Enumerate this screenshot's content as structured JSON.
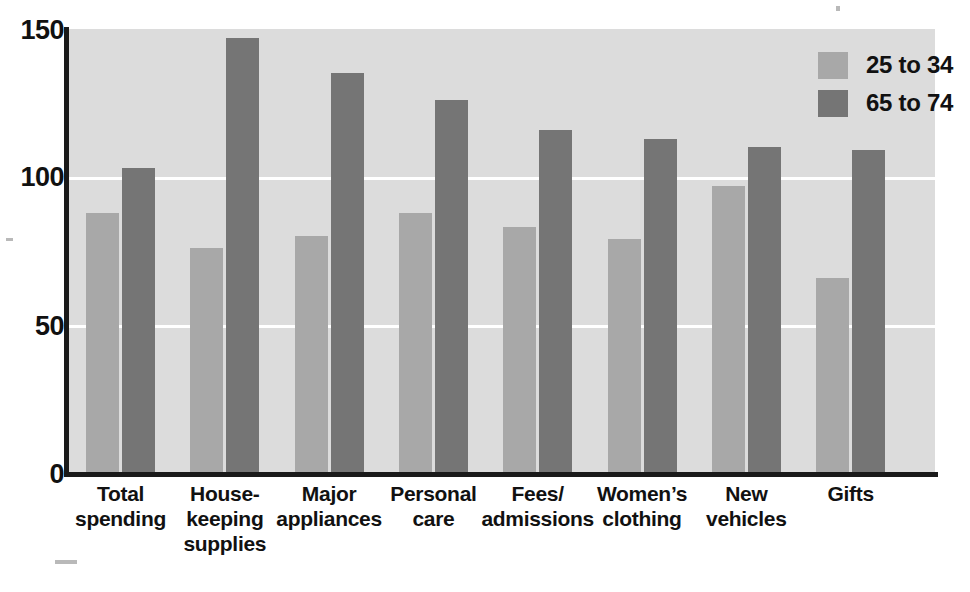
{
  "chart_data": {
    "type": "bar",
    "title": "",
    "subtitle": "",
    "xlabel": "",
    "ylabel": "",
    "ylim": [
      0,
      150
    ],
    "yticks": [
      0,
      50,
      100,
      150
    ],
    "ytick_labels": [
      "0",
      "50",
      "100",
      "150"
    ],
    "grid": true,
    "gridlines_at": [
      50,
      100
    ],
    "legend_position": "top-right",
    "categories": [
      "Total spending",
      "House-keeping supplies",
      "Major appliances",
      "Personal care",
      "Fees/ admissions",
      "Women’s clothing",
      "New vehicles",
      "Gifts"
    ],
    "category_lines": [
      [
        "Total",
        "spending"
      ],
      [
        "House-",
        "keeping",
        "supplies"
      ],
      [
        "Major",
        "appliances"
      ],
      [
        "Personal",
        "care"
      ],
      [
        "Fees/",
        "admissions"
      ],
      [
        "Women’s",
        "clothing"
      ],
      [
        "New",
        "vehicles"
      ],
      [
        "Gifts"
      ]
    ],
    "series": [
      {
        "name": "25 to 34",
        "color": "#a8a8a8",
        "values": [
          88,
          76,
          80,
          88,
          83,
          79,
          97,
          66
        ]
      },
      {
        "name": "65 to 74",
        "color": "#757575",
        "values": [
          103,
          147,
          135,
          126,
          116,
          113,
          110,
          109
        ]
      }
    ]
  },
  "legend": {
    "items": [
      {
        "label": "25 to 34",
        "color": "#a8a8a8"
      },
      {
        "label": "65 to 74",
        "color": "#757575"
      }
    ]
  },
  "axis": {
    "y_labels": [
      "150",
      "100",
      "50",
      "0"
    ]
  },
  "style": {
    "plot_background": "#dcdcdc",
    "gridline_color": "#ffffff",
    "axis_color": "#1a1a1a",
    "page_background": "#ffffff",
    "text_color": "#111111"
  }
}
